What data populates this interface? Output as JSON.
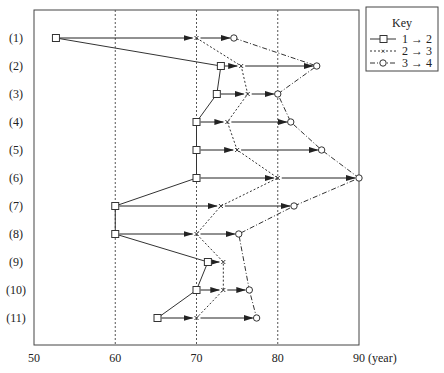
{
  "chart_data": {
    "type": "line",
    "title": "",
    "xlabel": "(year)",
    "ylabel": "",
    "xlim": [
      50,
      90
    ],
    "x_ticks": [
      50,
      60,
      70,
      80,
      90
    ],
    "x_tick_labels": [
      "50",
      "60",
      "70",
      "80",
      "90 (year)"
    ],
    "vertical_gridlines": [
      60,
      70,
      80
    ],
    "grid": "dotted vertical lines at 60, 70, 80",
    "categories": [
      "(1)",
      "(2)",
      "(3)",
      "(4)",
      "(5)",
      "(6)",
      "(7)",
      "(8)",
      "(9)",
      "(10)",
      "(11)"
    ],
    "series": [
      {
        "name": "1 → 2",
        "marker": "square",
        "line": "solid",
        "values": [
          52.7,
          73.0,
          72.5,
          70.0,
          70.0,
          70.0,
          60.0,
          60.0,
          71.4,
          70.0,
          65.2
        ]
      },
      {
        "name": "2 → 3",
        "marker": "x",
        "line": "dotted",
        "values": [
          70.0,
          75.5,
          76.3,
          73.8,
          75.0,
          80.0,
          73.0,
          70.0,
          73.3,
          73.3,
          70.0
        ]
      },
      {
        "name": "3 → 4",
        "marker": "circle",
        "line": "dash-dot",
        "values": [
          74.6,
          84.8,
          80.0,
          81.6,
          85.4,
          90.0,
          82.0,
          75.2,
          null,
          76.5,
          77.4
        ]
      }
    ],
    "arrows": "each row has arrows from square → x → circle",
    "legend": {
      "title": "Key",
      "position": "top-right outside",
      "entries": [
        "1 → 2",
        "2 → 3",
        "3 → 4"
      ]
    }
  },
  "legend": {
    "title": "Key",
    "entries": [
      {
        "label": "1 → 2"
      },
      {
        "label": "2 → 3"
      },
      {
        "label": "3 → 4"
      }
    ]
  },
  "axis": {
    "tick_labels": [
      "50",
      "60",
      "70",
      "80",
      "90 (year)"
    ]
  },
  "rows": [
    "(1)",
    "(2)",
    "(3)",
    "(4)",
    "(5)",
    "(6)",
    "(7)",
    "(8)",
    "(9)",
    "(10)",
    "(11)"
  ]
}
